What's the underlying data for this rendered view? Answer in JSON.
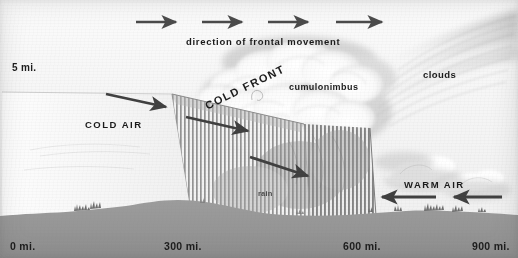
{
  "figure": {
    "kind": "cold-front-cross-section-diagram",
    "width": 518,
    "height": 258,
    "style": "vintage halftone textbook illustration, grayscale"
  },
  "labels": {
    "direction_of_movement": "direction of frontal movement",
    "cumulonimbus": "cumulonimbus",
    "clouds": "clouds",
    "cold_air": "COLD AIR",
    "warm_air": "WARM AIR",
    "cold_front": "COLD FRONT",
    "rain": "rain",
    "altitude": "5 mi."
  },
  "axis": {
    "name": "distance-scale",
    "unit": "mi.",
    "ticks": [
      "0 mi.",
      "300 mi.",
      "600 mi.",
      "900 mi."
    ]
  },
  "arrows": {
    "frontal_movement": {
      "count": 4,
      "direction": "right",
      "label": "direction of frontal movement"
    },
    "cold_air_flow": {
      "count": 3,
      "direction": "right-down",
      "label": "COLD AIR"
    },
    "warm_air_flow": {
      "count": 2,
      "direction": "left",
      "label": "WARM AIR"
    }
  },
  "colors": {
    "ink": "#1b1b1b",
    "arrow": "#4b4b4b",
    "ground": "#9a9a9a",
    "rain_hatch": "#8d8d8d",
    "sky": "#f6f6f5",
    "cloud": "#ffffff",
    "wedge_fill": "#fdfdfd"
  }
}
